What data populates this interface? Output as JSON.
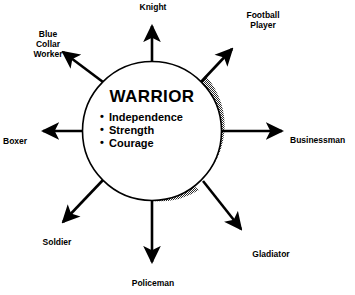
{
  "diagram": {
    "type": "radial-concept-map",
    "center": {
      "title": "WARRIOR",
      "traits": [
        "Independence",
        "Strength",
        "Courage"
      ]
    },
    "nodes": [
      {
        "id": "knight",
        "label": "Knight",
        "lines": [
          "Knight"
        ],
        "angle_deg": 90,
        "direction": "up"
      },
      {
        "id": "football-player",
        "label": "Football Player",
        "lines": [
          "Football",
          "Player"
        ],
        "angle_deg": 45,
        "direction": "up-right"
      },
      {
        "id": "businessman",
        "label": "Businessman",
        "lines": [
          "Businessman"
        ],
        "angle_deg": 0,
        "direction": "right"
      },
      {
        "id": "gladiator",
        "label": "Gladiator",
        "lines": [
          "Gladiator"
        ],
        "angle_deg": -45,
        "direction": "down-right"
      },
      {
        "id": "policeman",
        "label": "Policeman",
        "lines": [
          "Policeman"
        ],
        "angle_deg": -90,
        "direction": "down"
      },
      {
        "id": "soldier",
        "label": "Soldier",
        "lines": [
          "Soldier"
        ],
        "angle_deg": -135,
        "direction": "down-left"
      },
      {
        "id": "boxer",
        "label": "Boxer",
        "lines": [
          "Boxer"
        ],
        "angle_deg": 180,
        "direction": "left"
      },
      {
        "id": "blue-collar-worker",
        "label": "Blue Collar Worker",
        "lines": [
          "Blue",
          "Collar",
          "Worker"
        ],
        "angle_deg": 135,
        "direction": "up-left"
      }
    ],
    "colors": {
      "stroke": "#000000",
      "fill": "#ffffff",
      "shadow": "#9a9a9a",
      "background": "#ffffff"
    }
  }
}
